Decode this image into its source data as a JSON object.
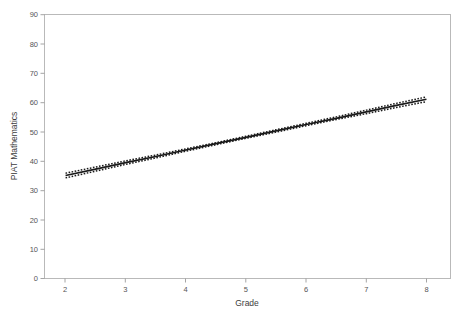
{
  "chart_data": {
    "type": "line",
    "title": "",
    "subtitle": "",
    "xlabel": "Grade",
    "ylabel": "PIAT Mathematics",
    "xlim": [
      1.65,
      8.4
    ],
    "ylim": [
      0,
      90
    ],
    "xticks": [
      2,
      3,
      4,
      5,
      6,
      7,
      8
    ],
    "yticks": [
      0,
      10,
      20,
      30,
      40,
      50,
      60,
      70,
      80,
      90
    ],
    "xtick_labels": [
      "2",
      "3",
      "4",
      "5",
      "6",
      "7",
      "8"
    ],
    "ytick_labels": [
      "0",
      "10",
      "20",
      "30",
      "40",
      "50",
      "60",
      "70",
      "80",
      "90"
    ],
    "grid": false,
    "legend": "none",
    "series": [
      {
        "name": "Regression fit",
        "style": "solid",
        "color": "#1a1a1a",
        "x": [
          2.0,
          2.5,
          3.0,
          3.5,
          4.0,
          4.5,
          5.0,
          5.5,
          6.0,
          6.5,
          7.0,
          7.5,
          8.0
        ],
        "values": [
          35.1,
          37.3,
          39.5,
          41.6,
          43.8,
          46.0,
          48.1,
          50.3,
          52.5,
          54.6,
          56.8,
          59.0,
          61.1
        ]
      },
      {
        "name": "Upper confidence limit",
        "style": "dotted",
        "color": "#1a1a1a",
        "x": [
          2.0,
          2.5,
          3.0,
          3.5,
          4.0,
          4.5,
          5.0,
          5.5,
          6.0,
          6.5,
          7.0,
          7.5,
          8.0
        ],
        "values": [
          35.9,
          38.0,
          40.1,
          42.1,
          44.2,
          46.3,
          48.5,
          50.7,
          52.9,
          55.1,
          57.4,
          59.7,
          61.9
        ]
      },
      {
        "name": "Lower confidence limit",
        "style": "dotted",
        "color": "#1a1a1a",
        "x": [
          2.0,
          2.5,
          3.0,
          3.5,
          4.0,
          4.5,
          5.0,
          5.5,
          6.0,
          6.5,
          7.0,
          7.5,
          8.0
        ],
        "values": [
          34.3,
          36.6,
          38.9,
          41.1,
          43.4,
          45.6,
          47.8,
          49.9,
          52.1,
          54.2,
          56.2,
          58.3,
          60.3
        ]
      }
    ]
  },
  "axes": {
    "x_title": "Grade",
    "y_title": "PIAT Mathematics"
  },
  "colors": {
    "frame": "#b9b9b9",
    "line": "#1a1a1a",
    "text": "#3d3d3d",
    "background": "#ffffff"
  }
}
